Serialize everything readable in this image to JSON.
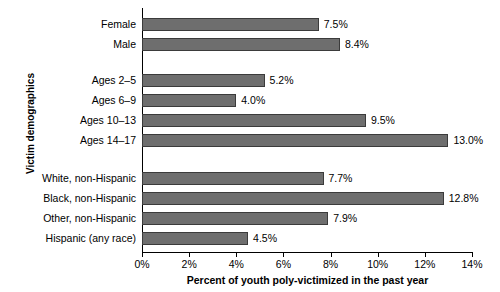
{
  "chart_data": {
    "type": "bar",
    "orientation": "horizontal",
    "title": "",
    "xlabel": "Percent of youth poly-victimized in the past year",
    "ylabel": "Victim demographics",
    "xlim": [
      0,
      14
    ],
    "xticks": [
      "0%",
      "2%",
      "4%",
      "6%",
      "8%",
      "10%",
      "12%",
      "14%"
    ],
    "xtick_values": [
      0,
      2,
      4,
      6,
      8,
      10,
      12,
      14
    ],
    "grid": false,
    "legend": "none",
    "bar_color": "#6e6e6e",
    "categories": [
      "Female",
      "Male",
      "Ages 2–5",
      "Ages 6–9",
      "Ages 10–13",
      "Ages 14–17",
      "White, non-Hispanic",
      "Black, non-Hispanic",
      "Other, non-Hispanic",
      "Hispanic (any race)"
    ],
    "values": [
      7.5,
      8.4,
      5.2,
      4.0,
      9.5,
      13.0,
      7.7,
      12.8,
      7.9,
      4.5
    ],
    "value_labels": [
      "7.5%",
      "8.4%",
      "5.2%",
      "4.0%",
      "9.5%",
      "13.0%",
      "7.7%",
      "12.8%",
      "7.9%",
      "4.5%"
    ],
    "groups": [
      {
        "name": "sex",
        "indices": [
          0,
          1
        ]
      },
      {
        "name": "age",
        "indices": [
          2,
          3,
          4,
          5
        ]
      },
      {
        "name": "raceethnicity",
        "indices": [
          6,
          7,
          8,
          9
        ]
      }
    ]
  }
}
